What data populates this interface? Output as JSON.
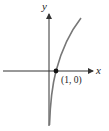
{
  "figure": {
    "type": "function-graph",
    "function": "y = ln x",
    "axes": {
      "x_label": "x",
      "y_label": "y"
    },
    "point": {
      "label": "(1, 0)",
      "x": 1,
      "y": 0
    },
    "colors": {
      "axes": "#333333",
      "curve": "#777777",
      "point": "#111111",
      "background": "#ffffff"
    }
  }
}
